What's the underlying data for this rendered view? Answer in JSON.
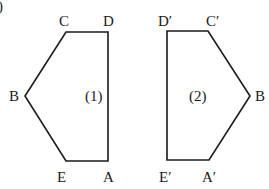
{
  "diagram": {
    "corner_mark": ")",
    "figures": [
      {
        "id": "figure-1",
        "label": "(1)",
        "label_pos": [
          85,
          101
        ],
        "vertices": [
          {
            "name": "A",
            "x": 108,
            "y": 161,
            "label_x": 103,
            "label_y": 182
          },
          {
            "name": "D",
            "x": 108,
            "y": 32,
            "label_x": 103,
            "label_y": 26
          },
          {
            "name": "C",
            "x": 66,
            "y": 32,
            "label_x": 59,
            "label_y": 26
          },
          {
            "name": "B",
            "x": 25,
            "y": 96,
            "label_x": 9,
            "label_y": 101
          },
          {
            "name": "E",
            "x": 66,
            "y": 161,
            "label_x": 57,
            "label_y": 182
          }
        ]
      },
      {
        "id": "figure-2",
        "label": "(2)",
        "label_pos": [
          189,
          101
        ],
        "vertices": [
          {
            "name": "E′",
            "x": 167,
            "y": 160,
            "label_x": 159,
            "label_y": 182
          },
          {
            "name": "D′",
            "x": 167,
            "y": 31,
            "label_x": 158,
            "label_y": 26
          },
          {
            "name": "C′",
            "x": 208,
            "y": 31,
            "label_x": 206,
            "label_y": 26
          },
          {
            "name": "B",
            "x": 250,
            "y": 96,
            "label_x": 255,
            "label_y": 101
          },
          {
            "name": "A′",
            "x": 209,
            "y": 160,
            "label_x": 202,
            "label_y": 182
          }
        ]
      }
    ]
  }
}
